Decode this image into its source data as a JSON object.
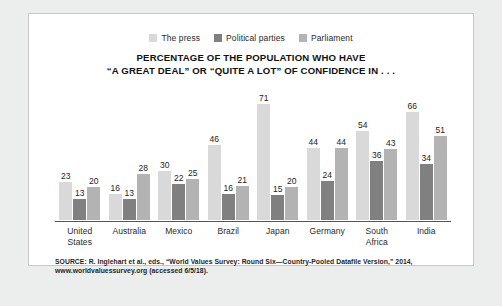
{
  "card": {
    "background": "#ffffff",
    "border_color": "#c8c8c8"
  },
  "chart_data": {
    "type": "bar",
    "title_line1": "PERCENTAGE OF THE POPULATION WHO HAVE",
    "title_line2": "“A GREAT DEAL” OR “QUITE A LOT” OF CONFIDENCE IN . . .",
    "xlabel": "",
    "ylabel": "",
    "ylim": [
      0,
      75
    ],
    "grid": false,
    "legend_position": "top-center",
    "categories": [
      "United States",
      "Australia",
      "Mexico",
      "Brazil",
      "Japan",
      "Germany",
      "South Africa",
      "India"
    ],
    "category_labels": [
      "United\nStates",
      "Australia",
      "Mexico",
      "Brazil",
      "Japan",
      "Germany",
      "South\nAfrica",
      "India"
    ],
    "series": [
      {
        "name": "The press",
        "color": "#d9d9d9",
        "values": [
          23,
          16,
          30,
          46,
          71,
          44,
          54,
          66
        ]
      },
      {
        "name": "Political parties",
        "color": "#808080",
        "values": [
          13,
          13,
          22,
          16,
          15,
          24,
          36,
          34
        ]
      },
      {
        "name": "Parliament",
        "color": "#b3b3b3",
        "values": [
          20,
          28,
          25,
          21,
          20,
          44,
          43,
          51
        ]
      }
    ]
  },
  "source": {
    "line1": "SOURCE: R. Inglehart et al., eds., “World Values Survey: Round Six—Country-Pooled Datafile Version,” 2014,",
    "line2": "www.worldvaluessurvey.org (accessed 6/5/18)."
  }
}
